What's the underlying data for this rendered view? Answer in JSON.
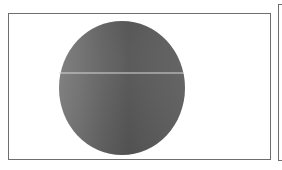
{
  "figure": {
    "shape": "circle",
    "colors": {
      "fill_light": "#8a8a8a",
      "fill_mid": "#6a6a6a",
      "fill_dark": "#555555",
      "line": "#d8d8d8",
      "frame": "#6e6e6e"
    },
    "labels": []
  }
}
